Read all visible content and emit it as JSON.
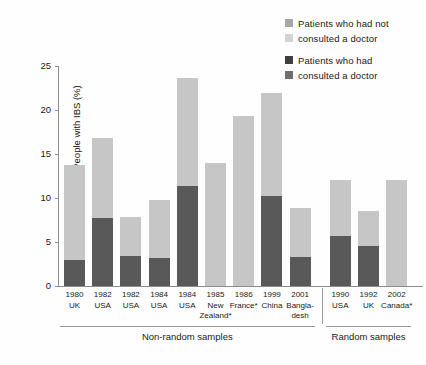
{
  "chart_data": {
    "type": "bar",
    "title": "",
    "subtitle": "",
    "xlabel": "",
    "ylabel": "People with IBS (%)",
    "ylim": [
      0,
      25
    ],
    "yticks": [
      0,
      5,
      10,
      15,
      20,
      25
    ],
    "ytick_labels": [
      "0",
      "5",
      "10",
      "15",
      "20",
      "25"
    ],
    "grid": false,
    "stacked": true,
    "legend_position": "top-right",
    "categories": [
      "1980 UK",
      "1982 USA",
      "1982 USA",
      "1984 USA",
      "1984 USA",
      "1985 New Zealand*",
      "1986 France*",
      "1999 China",
      "2001 Bangladesh",
      "1990 USA",
      "1992 UK",
      "2002 Canada*"
    ],
    "category_lines": [
      {
        "year": "1980",
        "place": "UK"
      },
      {
        "year": "1982",
        "place": "USA"
      },
      {
        "year": "1982",
        "place": "USA"
      },
      {
        "year": "1984",
        "place": "USA"
      },
      {
        "year": "1984",
        "place": "USA"
      },
      {
        "year": "1985",
        "place": "New",
        "place2": "Zealand*"
      },
      {
        "year": "1986",
        "place": "France*"
      },
      {
        "year": "1999",
        "place": "China"
      },
      {
        "year": "2001",
        "place": "Bangla-",
        "place2": "desh"
      },
      {
        "year": "1990",
        "place": "USA"
      },
      {
        "year": "1992",
        "place": "UK"
      },
      {
        "year": "2002",
        "place": "Canada*"
      }
    ],
    "series": [
      {
        "name": "Patients who had consulted a doctor",
        "color": "#595959",
        "values": [
          3.0,
          7.7,
          3.4,
          3.2,
          11.4,
          0,
          0,
          10.2,
          3.3,
          5.7,
          4.5,
          0
        ]
      },
      {
        "name": "Patients who had not consulted a doctor",
        "color": "#c6c6c6",
        "values": [
          10.8,
          9.1,
          4.5,
          6.6,
          12.2,
          14.0,
          19.3,
          11.7,
          5.6,
          6.3,
          4.0,
          12.1
        ]
      }
    ],
    "totals": [
      13.8,
      16.8,
      7.9,
      9.8,
      23.6,
      14.0,
      19.3,
      21.9,
      8.9,
      12.0,
      8.5,
      12.1
    ],
    "groups": [
      {
        "label": "Non-random samples",
        "start": 0,
        "end": 8
      },
      {
        "label": "Random samples",
        "start": 9,
        "end": 11
      }
    ]
  },
  "legend": {
    "entries": [
      {
        "swatch_color": "#a8a8a8",
        "line1": "Patients who had not",
        "swatch_color2": "#d3d3d3",
        "line2": "consulted a doctor"
      },
      {
        "swatch_color": "#3f3f3f",
        "line1": "Patients who had",
        "swatch_color2": "#6e6e6e",
        "line2": "consulted a doctor"
      }
    ]
  },
  "colors": {
    "not_consulted": "#c6c6c6",
    "consulted": "#595959",
    "axis": "#8d8d8d",
    "text": "#1a1a1a",
    "background": "#fefefe"
  }
}
